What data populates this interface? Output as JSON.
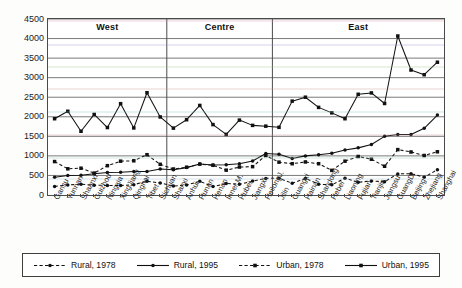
{
  "chart_data": {
    "type": "line",
    "title": "",
    "xlabel": "",
    "ylabel": "",
    "ylim": [
      0,
      4500
    ],
    "ytick_step": 500,
    "yticks": [
      "0",
      "500",
      "1000",
      "1500",
      "2000",
      "2500",
      "3000",
      "3500",
      "4000",
      "4500"
    ],
    "grid": true,
    "legend_position": "bottom",
    "categories": [
      "Gansu",
      "Yunnan",
      "Shaanxi",
      "Guizhou",
      "Ningxia",
      "XingJiang",
      "Qinghai",
      "Tibet",
      "Sichuan",
      "Shanxi",
      "Anhui",
      "Hunan",
      "Henan",
      "Inner M.",
      "Hubei",
      "Jiangxi",
      "HeilongJ.",
      "Jilin",
      "Guangxi",
      "Hainan",
      "Shandong",
      "Hebei",
      "Liaoning",
      "Fujian",
      "Tianjin",
      "Jiangsu",
      "GuangD.",
      "Beijing",
      "Zhejiang",
      "Shanghai"
    ],
    "region_bands": [
      {
        "label": "West",
        "start": 0,
        "end": 8
      },
      {
        "label": "Centre",
        "start": 9,
        "end": 16
      },
      {
        "label": "East",
        "start": 17,
        "end": 29
      }
    ],
    "series": [
      {
        "name": "Rural, 1978",
        "style": "dashed",
        "marker": "dot",
        "color": "#111111",
        "values": [
          220,
          255,
          275,
          250,
          245,
          240,
          265,
          350,
          310,
          230,
          255,
          350,
          215,
          295,
          275,
          355,
          425,
          430,
          300,
          425,
          275,
          260,
          430,
          325,
          360,
          340,
          540,
          545,
          455,
          645
        ]
      },
      {
        "name": "Rural, 1995",
        "style": "solid",
        "marker": "dot",
        "color": "#111111",
        "values": [
          455,
          500,
          505,
          545,
          575,
          580,
          600,
          600,
          665,
          645,
          700,
          790,
          765,
          775,
          800,
          870,
          1060,
          1040,
          935,
          1000,
          1030,
          1070,
          1150,
          1205,
          1290,
          1500,
          1545,
          1545,
          1705,
          2045
        ]
      },
      {
        "name": "Urban, 1978",
        "style": "dashed",
        "marker": "square",
        "color": "#111111",
        "values": [
          855,
          670,
          685,
          560,
          750,
          865,
          875,
          1030,
          785,
          665,
          710,
          790,
          760,
          635,
          715,
          725,
          1010,
          840,
          800,
          845,
          800,
          630,
          865,
          985,
          915,
          735,
          1160,
          1100,
          1010,
          1105
        ]
      },
      {
        "name": "Urban, 1995",
        "style": "solid",
        "marker": "square",
        "color": "#111111",
        "values": [
          1950,
          2140,
          1630,
          2060,
          1725,
          2335,
          1715,
          2615,
          1995,
          1710,
          1925,
          2290,
          1800,
          1550,
          1915,
          1780,
          1760,
          1730,
          2400,
          2500,
          2240,
          2100,
          1950,
          2575,
          2610,
          2340,
          4065,
          3195,
          3075,
          3395
        ]
      }
    ]
  },
  "legend": {
    "items": [
      {
        "label": "Rural, 1978"
      },
      {
        "label": "Rural, 1995"
      },
      {
        "label": "Urban, 1978"
      },
      {
        "label": "Urban, 1995"
      }
    ]
  },
  "colors": {
    "axis": "#4a4a4a",
    "grid": "#6b6b6b",
    "line": "#111111",
    "background": "#ffffff"
  }
}
